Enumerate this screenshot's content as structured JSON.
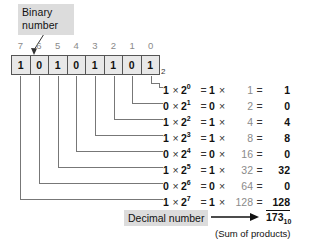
{
  "figure": {
    "callout": {
      "line1": "Binary",
      "line2": "number"
    },
    "base_subscript": "2",
    "bit_indices": [
      "7",
      "6",
      "5",
      "4",
      "3",
      "2",
      "1",
      "0"
    ],
    "bits": [
      "1",
      "0",
      "1",
      "0",
      "1",
      "1",
      "0",
      "1"
    ],
    "equations": [
      {
        "bit": "1",
        "times": "×",
        "base": "2",
        "exp": "0",
        "eq": "=",
        "product_bit": "1",
        "times2": "×",
        "weight": "1",
        "eq2": "=",
        "result": "1"
      },
      {
        "bit": "0",
        "times": "×",
        "base": "2",
        "exp": "1",
        "eq": "=",
        "product_bit": "0",
        "times2": "×",
        "weight": "2",
        "eq2": "=",
        "result": "0"
      },
      {
        "bit": "1",
        "times": "×",
        "base": "2",
        "exp": "2",
        "eq": "=",
        "product_bit": "1",
        "times2": "×",
        "weight": "4",
        "eq2": "=",
        "result": "4"
      },
      {
        "bit": "1",
        "times": "×",
        "base": "2",
        "exp": "3",
        "eq": "=",
        "product_bit": "1",
        "times2": "×",
        "weight": "8",
        "eq2": "=",
        "result": "8"
      },
      {
        "bit": "0",
        "times": "×",
        "base": "2",
        "exp": "4",
        "eq": "=",
        "product_bit": "0",
        "times2": "×",
        "weight": "16",
        "eq2": "=",
        "result": "0"
      },
      {
        "bit": "1",
        "times": "×",
        "base": "2",
        "exp": "5",
        "eq": "=",
        "product_bit": "1",
        "times2": "×",
        "weight": "32",
        "eq2": "=",
        "result": "32"
      },
      {
        "bit": "0",
        "times": "×",
        "base": "2",
        "exp": "6",
        "eq": "=",
        "product_bit": "0",
        "times2": "×",
        "weight": "64",
        "eq2": "=",
        "result": "0"
      },
      {
        "bit": "1",
        "times": "×",
        "base": "2",
        "exp": "7",
        "eq": "=",
        "product_bit": "1",
        "times2": "×",
        "weight": "128",
        "eq2": "=",
        "result": "128"
      }
    ],
    "decimal_label": "Decimal number",
    "total": {
      "value": "173",
      "subscript": "10"
    },
    "sum_note": "(Sum of products)",
    "colors": {
      "box_fill": "#e8e8e8",
      "box_border": "#555555",
      "label_fill": "#dcdcdc",
      "leader_line": "#777777",
      "text": "#111111",
      "muted_text": "#8a8a8a"
    }
  }
}
